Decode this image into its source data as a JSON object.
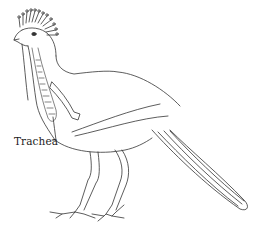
{
  "diagram": {
    "labels": [
      {
        "text": "Trachea",
        "target": "trachea"
      }
    ],
    "colors": {
      "line": "#333333",
      "background": "#ffffff"
    }
  }
}
